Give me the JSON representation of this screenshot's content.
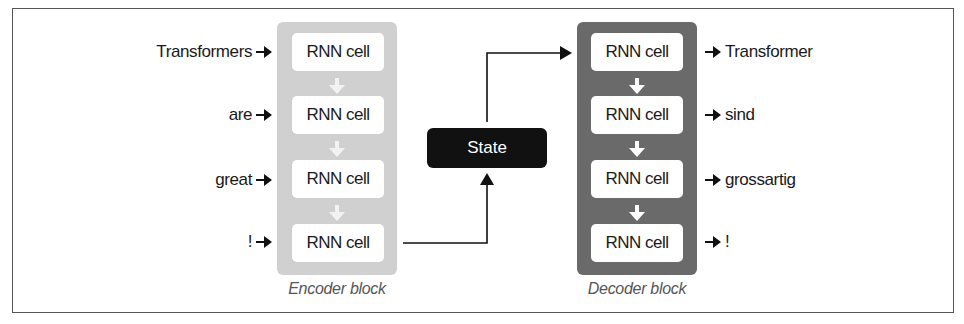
{
  "encoder": {
    "caption": "Encoder block",
    "cell_label": "RNN cell",
    "inputs": [
      "Transformers",
      "are",
      "great",
      "!"
    ],
    "cells": [
      "RNN cell",
      "RNN cell",
      "RNN cell",
      "RNN cell"
    ],
    "color": "#d0d0d0"
  },
  "state": {
    "label": "State",
    "color": "#111111"
  },
  "decoder": {
    "caption": "Decoder block",
    "cell_label": "RNN cell",
    "cells": [
      "RNN cell",
      "RNN cell",
      "RNN cell",
      "RNN cell"
    ],
    "outputs": [
      "Transformer",
      "sind",
      "grossartig",
      "!"
    ],
    "color": "#6a6a6a"
  },
  "icons": {
    "input_arrow": "arrow-right-icon",
    "output_arrow": "arrow-right-icon",
    "flow_arrow": "arrow-down-icon"
  }
}
